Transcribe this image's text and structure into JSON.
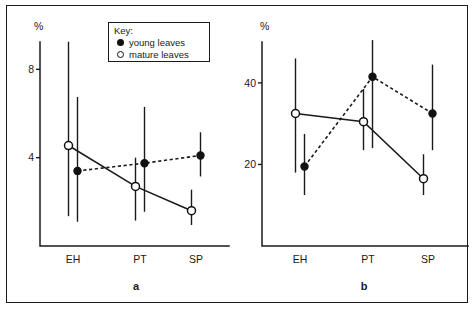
{
  "figure": {
    "legend": {
      "title": "Key:",
      "entries": [
        {
          "marker": "filled-circle",
          "label": "young leaves"
        },
        {
          "marker": "open-circle",
          "label": "mature leaves"
        }
      ]
    }
  },
  "chart_data": [
    {
      "panel": "a",
      "panel_label": "a",
      "type": "line",
      "title": "",
      "xlabel": "",
      "ylabel": "%",
      "axis_unit_label": "%",
      "categories": [
        "EH",
        "PT",
        "SP"
      ],
      "yticks": [
        4,
        8
      ],
      "ytick_labels": [
        "4",
        "8"
      ],
      "ylim": [
        0,
        9.6
      ],
      "grid": false,
      "legend_position": "top-center",
      "series": [
        {
          "name": "young leaves",
          "marker": "filled-circle",
          "linestyle": "dashed",
          "values": [
            3.4,
            3.75,
            4.1
          ],
          "err_low": [
            1.1,
            1.55,
            3.15
          ],
          "err_high": [
            6.75,
            6.3,
            5.15
          ]
        },
        {
          "name": "mature leaves",
          "marker": "open-circle",
          "linestyle": "solid",
          "values": [
            4.55,
            2.7,
            1.6
          ],
          "err_low": [
            1.35,
            1.15,
            0.95
          ],
          "err_high": [
            9.25,
            4.0,
            2.55
          ]
        }
      ]
    },
    {
      "panel": "b",
      "panel_label": "b",
      "type": "line",
      "title": "",
      "xlabel": "",
      "ylabel": "%",
      "axis_unit_label": "%",
      "categories": [
        "EH",
        "PT",
        "SP"
      ],
      "yticks": [
        20,
        40
      ],
      "ytick_labels": [
        "20",
        "40"
      ],
      "ylim": [
        0,
        52
      ],
      "grid": false,
      "legend_position": "none",
      "series": [
        {
          "name": "young leaves",
          "marker": "filled-circle",
          "linestyle": "dashed",
          "values": [
            19.5,
            41.5,
            32.5
          ],
          "err_low": [
            12.5,
            24.0,
            23.5
          ],
          "err_high": [
            27.5,
            50.5,
            44.5
          ]
        },
        {
          "name": "mature leaves",
          "marker": "open-circle",
          "linestyle": "solid",
          "values": [
            32.5,
            30.5,
            16.5
          ],
          "err_low": [
            18.0,
            23.5,
            12.5
          ],
          "err_high": [
            46.0,
            38.5,
            22.5
          ]
        }
      ]
    }
  ]
}
